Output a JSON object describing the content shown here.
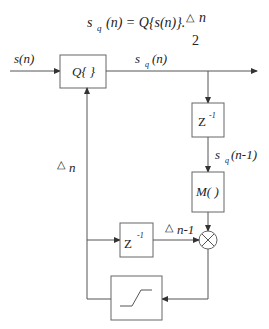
{
  "diagram": {
    "equation": {
      "lhs_s": "s",
      "lhs_sub": "q",
      "lhs_arg": "(n) = Q{s(n)}.",
      "numerator_delta": "△",
      "numerator_n": "n",
      "denominator": "2"
    },
    "input_label": "s(n)",
    "output_label": {
      "s": "s",
      "sub": "q",
      "arg": "(n)"
    },
    "delayed_label": {
      "s": "s",
      "sub": "q",
      "arg": "(n-1)"
    },
    "step_label": {
      "delta": "△",
      "n": "n"
    },
    "delayed_step_label": {
      "delta": "△",
      "n": "n-1"
    },
    "blocks": {
      "quantizer": "Q{ }",
      "delay_top": {
        "z": "Z",
        "exp": "-1"
      },
      "mapper": "M( )",
      "delay_bottom": {
        "z": "Z",
        "exp": "-1"
      },
      "multiplier": "×",
      "limiter": "saturation"
    }
  }
}
